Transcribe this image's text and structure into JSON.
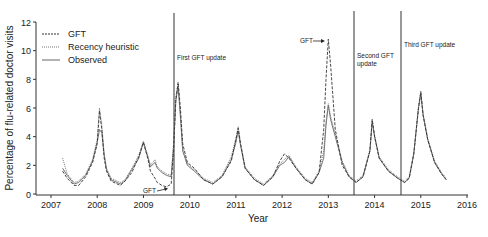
{
  "chart_data": {
    "type": "line",
    "title": "",
    "xlabel": "Year",
    "ylabel": "Percentage of flu-related doctor visits",
    "xlim": [
      2007,
      2016
    ],
    "ylim": [
      0,
      12
    ],
    "x_ticks": [
      "2007",
      "2008",
      "2009",
      "2010",
      "2011",
      "2012",
      "2013",
      "2014",
      "2015",
      "2016"
    ],
    "y_ticks": [
      "0",
      "2",
      "4",
      "6",
      "8",
      "10",
      "12"
    ],
    "grid": false,
    "legend_position": "upper-left",
    "legend": [
      "GFT",
      "Recency heuristic",
      "Observed"
    ],
    "x": [
      2007.25,
      2007.35,
      2007.5,
      2007.6,
      2007.75,
      2007.9,
      2008.0,
      2008.05,
      2008.1,
      2008.15,
      2008.2,
      2008.3,
      2008.5,
      2008.6,
      2008.75,
      2008.9,
      2009.0,
      2009.1,
      2009.15,
      2009.25,
      2009.3,
      2009.4,
      2009.5,
      2009.6,
      2009.65,
      2009.7,
      2009.75,
      2009.8,
      2009.85,
      2009.95,
      2010.1,
      2010.3,
      2010.5,
      2010.7,
      2010.9,
      2011.0,
      2011.05,
      2011.1,
      2011.2,
      2011.4,
      2011.6,
      2011.8,
      2011.95,
      2012.05,
      2012.15,
      2012.3,
      2012.5,
      2012.65,
      2012.8,
      2012.9,
      2012.95,
      2013.0,
      2013.05,
      2013.15,
      2013.3,
      2013.45,
      2013.6,
      2013.75,
      2013.9,
      2013.95,
      2014.0,
      2014.1,
      2014.3,
      2014.5,
      2014.65,
      2014.75,
      2014.85,
      2014.95,
      2015.0,
      2015.05,
      2015.15,
      2015.3,
      2015.45,
      2015.55
    ],
    "series": [
      {
        "name": "GFT",
        "style": "dashed",
        "values": [
          1.6,
          1.1,
          0.6,
          0.6,
          1.2,
          2.2,
          3.5,
          5.8,
          4.5,
          2.5,
          1.6,
          0.9,
          0.6,
          0.9,
          1.5,
          2.6,
          3.6,
          2.4,
          1.6,
          1.1,
          0.8,
          0.6,
          0.5,
          0.7,
          3.0,
          6.5,
          7.8,
          6.0,
          3.5,
          2.2,
          1.8,
          1.0,
          0.7,
          1.2,
          2.3,
          3.8,
          4.6,
          3.5,
          1.8,
          1.0,
          0.6,
          1.2,
          2.3,
          2.8,
          2.5,
          1.8,
          1.0,
          0.7,
          1.5,
          4.5,
          8.0,
          10.8,
          9.0,
          4.5,
          2.0,
          1.2,
          0.8,
          1.2,
          3.0,
          5.2,
          4.0,
          2.5,
          1.6,
          1.1,
          0.8,
          1.1,
          2.8,
          6.0,
          7.1,
          5.5,
          3.8,
          2.2,
          1.4,
          1.0
        ]
      },
      {
        "name": "Recency heuristic",
        "style": "dotted",
        "values": [
          2.5,
          1.4,
          0.8,
          0.9,
          1.4,
          2.4,
          3.8,
          6.0,
          4.8,
          2.8,
          1.8,
          1.1,
          0.8,
          1.0,
          1.8,
          2.7,
          3.7,
          2.6,
          2.0,
          2.4,
          1.9,
          1.6,
          1.4,
          1.3,
          3.5,
          6.8,
          7.7,
          5.6,
          3.2,
          2.1,
          1.7,
          1.1,
          0.8,
          1.3,
          2.6,
          3.9,
          4.7,
          3.6,
          1.9,
          1.1,
          0.7,
          1.3,
          2.1,
          2.4,
          2.7,
          1.9,
          1.1,
          0.8,
          1.6,
          3.0,
          5.0,
          6.3,
          5.4,
          4.2,
          2.3,
          1.3,
          0.9,
          1.3,
          3.1,
          5.2,
          4.1,
          2.6,
          1.7,
          1.2,
          0.9,
          1.2,
          2.9,
          6.1,
          7.2,
          5.6,
          3.9,
          2.3,
          1.5,
          1.1
        ]
      },
      {
        "name": "Observed",
        "style": "solid",
        "values": [
          1.8,
          1.3,
          0.7,
          0.8,
          1.3,
          2.3,
          3.6,
          4.5,
          4.3,
          2.7,
          1.7,
          1.0,
          0.7,
          0.9,
          1.7,
          2.5,
          3.6,
          2.5,
          1.9,
          2.2,
          1.8,
          1.5,
          1.3,
          1.2,
          3.2,
          6.5,
          7.5,
          5.4,
          3.0,
          2.0,
          1.6,
          1.0,
          0.7,
          1.2,
          2.4,
          3.6,
          4.4,
          3.4,
          1.8,
          1.0,
          0.6,
          1.2,
          2.0,
          2.2,
          2.6,
          1.8,
          1.0,
          0.7,
          1.5,
          2.5,
          4.8,
          6.2,
          5.2,
          4.0,
          2.2,
          1.2,
          0.8,
          1.2,
          3.0,
          5.0,
          4.0,
          2.5,
          1.6,
          1.1,
          0.8,
          1.1,
          2.8,
          6.0,
          7.0,
          5.5,
          3.8,
          2.2,
          1.4,
          1.0
        ]
      }
    ],
    "vertical_lines": [
      {
        "x": 2009.72,
        "label": "First GFT update"
      },
      {
        "x": 2013.6,
        "label": "Second GFT update"
      },
      {
        "x": 2014.6,
        "label": "Third GFT update"
      }
    ],
    "annotations": [
      {
        "text": "GFT",
        "arrow": "right",
        "x": 2009.6,
        "y": 0.5
      },
      {
        "text": "GFT",
        "arrow": "right",
        "x": 2012.95,
        "y": 10.8
      }
    ]
  },
  "labels": {
    "xlabel": "Year",
    "ylabel": "Percentage of flu-related doctor visits",
    "legend_gft": "GFT",
    "legend_recency": "Recency heuristic",
    "legend_observed": "Observed",
    "vline1": "First GFT update",
    "vline2a": "Second GFT",
    "vline2b": "update",
    "vline3": "Third GFT update",
    "gft_annot1": "GFT",
    "gft_annot2": "GFT"
  }
}
